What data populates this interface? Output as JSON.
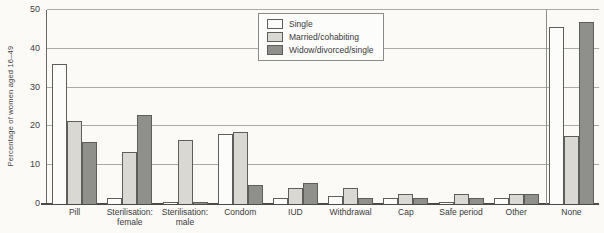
{
  "chart_data": {
    "type": "bar",
    "title": "",
    "xlabel": "",
    "ylabel": "Percentage of women aged 16–49",
    "ylim": [
      0,
      50
    ],
    "yticks": [
      0,
      10,
      20,
      30,
      40,
      50
    ],
    "grid": true,
    "legend_position": "top-center-inside",
    "categories": [
      "Pill",
      "Sterilisation:\nfemale",
      "Sterilisation:\nmale",
      "Condom",
      "IUD",
      "Withdrawal",
      "Cap",
      "Safe period",
      "Other",
      "None"
    ],
    "series": [
      {
        "name": "Single",
        "color": "#fcfcfa",
        "values": [
          36,
          1.5,
          0.4,
          18,
          1.5,
          2,
          1.5,
          0.4,
          1.5,
          45.5
        ]
      },
      {
        "name": "Married/cohabiting",
        "color": "#d9d8d2",
        "values": [
          21.5,
          13.5,
          16.5,
          18.5,
          4,
          4,
          2.5,
          2.5,
          2.5,
          17.5
        ]
      },
      {
        "name": "Widow/divorced/single",
        "color": "#8f8f8c",
        "values": [
          16,
          23,
          0.4,
          5,
          5.5,
          1.5,
          1.5,
          1.5,
          2.5,
          47
        ]
      }
    ],
    "separator_before_category": "None",
    "colors": {
      "background": "#fbfaf7",
      "gridline": "#a9a9a6",
      "axis": "#4a4a4a",
      "bar_border": "#5d5d5b"
    }
  }
}
